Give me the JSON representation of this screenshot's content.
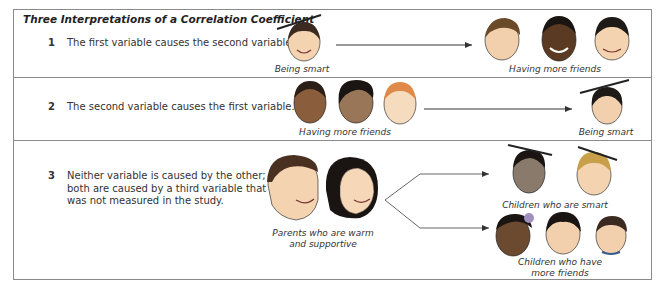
{
  "figure": {
    "title": "Three Interpretations of a Correlation Coefficient"
  },
  "rows": [
    {
      "number": "1",
      "statement": "The first variable causes the second variable.",
      "cause_label": "Being smart",
      "effect_label": "Having more friends"
    },
    {
      "number": "2",
      "statement": "The second variable causes the first variable.",
      "cause_label": "Having more friends",
      "effect_label": "Being smart"
    },
    {
      "number": "3",
      "statement_lines": [
        "Neither variable is caused by the other;",
        "both are caused by a third variable that",
        "was not measured in the study."
      ],
      "cause_label_lines": [
        "Parents who are warm",
        "and supportive"
      ],
      "effect_label_1": "Children who are smart",
      "effect_label_2_lines": [
        "Children who have",
        "more friends"
      ]
    }
  ],
  "icons": {
    "smart_child": "graduation-cap-child-face",
    "friend_child": "child-face",
    "parent": "adult-face"
  },
  "colors": {
    "border": "#8a8a8a",
    "arrow": "#333333",
    "skin_light": "#f4d4b0",
    "skin_dark": "#6b4a30",
    "skin_medium": "#a07a58",
    "hair_dark": "#1e1a18",
    "hair_brown": "#6b4a2a",
    "hair_orange": "#e08a4a",
    "hair_blond": "#c9a04a"
  }
}
